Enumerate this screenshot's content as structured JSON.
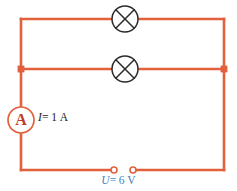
{
  "diagram": {
    "canvas": {
      "width": 237,
      "height": 191
    },
    "colors": {
      "wire": "#e2603c",
      "lamp_outline": "#2b2b2b",
      "meter_letter": "#c0392b",
      "current_text": "#1a1a1a",
      "voltage_text": "#3f7fc1",
      "background": "#ffffff"
    },
    "components": {
      "ammeter": {
        "symbol": "A",
        "name": "ammeter",
        "center": {
          "x": 21,
          "y": 120
        },
        "radius": 13
      },
      "lamp_top": {
        "name": "lamp-symbol",
        "center": {
          "x": 125,
          "y": 19
        },
        "radius": 13
      },
      "lamp_middle": {
        "name": "lamp-symbol",
        "center": {
          "x": 125,
          "y": 69
        },
        "radius": 13
      },
      "source_terminals": {
        "name": "voltage-source-terminals",
        "left": {
          "x": 114,
          "y": 170
        },
        "right": {
          "x": 133,
          "y": 170
        },
        "radius": 3
      },
      "junction_left": {
        "x": 21,
        "y": 69
      },
      "junction_right": {
        "x": 224,
        "y": 69
      }
    },
    "labels": {
      "current": {
        "symbol": "I",
        "equals": "=",
        "value": "1",
        "unit": "A",
        "full": "I = 1 A"
      },
      "voltage": {
        "symbol": "U",
        "equals": "=",
        "value": "6",
        "unit": "V",
        "full": "U = 6 V"
      }
    }
  }
}
